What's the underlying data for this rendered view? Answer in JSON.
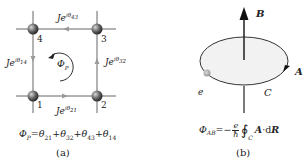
{
  "panel_a": {
    "nodes": [
      {
        "id": "1",
        "label": "1"
      },
      {
        "id": "2",
        "label": "2"
      },
      {
        "id": "3",
        "label": "3"
      },
      {
        "id": "4",
        "label": "4"
      }
    ],
    "bonds": {
      "top": {
        "base": "Je",
        "exp": "iθ",
        "sub": "43"
      },
      "left": {
        "base": "Je",
        "exp": "iθ",
        "sub": "14"
      },
      "right": {
        "base": "Je",
        "exp": "iθ",
        "sub": "32"
      },
      "bottom": {
        "base": "Je",
        "exp": "iθ",
        "sub": "21"
      }
    },
    "flux_label": {
      "symbol": "Φ",
      "sub": "P"
    },
    "formula": {
      "lhs_symbol": "Φ",
      "lhs_sub": "P",
      "eq": "=",
      "terms": [
        {
          "symbol": "θ",
          "sub": "21"
        },
        {
          "symbol": "θ",
          "sub": "32"
        },
        {
          "symbol": "θ",
          "sub": "43"
        },
        {
          "symbol": "θ",
          "sub": "14"
        }
      ],
      "plus": "+"
    },
    "caption": "(a)"
  },
  "panel_b": {
    "field_label": "B",
    "vector_potential_label": "A",
    "contour_label": "C",
    "charge_label": "e",
    "formula": {
      "lhs_symbol": "Φ",
      "lhs_sub": "AB",
      "eq": "=−",
      "frac_num": "e",
      "frac_den": "ħ",
      "integral": "∮",
      "int_sub": "C",
      "integrand_a": "A",
      "dot": "·d",
      "integrand_r": "R"
    },
    "caption": "(b)"
  },
  "colors": {
    "line": "#444444",
    "arrow_head": "#999999",
    "node_dark": "#333333",
    "node_light": "#cfcfcf",
    "ellipse_fill": "#f0f0f0",
    "charge": "#a8a8a8"
  }
}
